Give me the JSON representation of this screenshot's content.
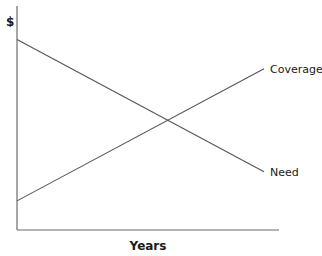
{
  "chart_data": {
    "type": "line",
    "title": "",
    "xlabel": "Years",
    "ylabel": "$",
    "x": [
      0,
      1
    ],
    "xlim": [
      0,
      1
    ],
    "ylim": [
      0,
      1
    ],
    "grid": false,
    "legend": "none (direct labels at right end of lines)",
    "series": [
      {
        "name": "Need",
        "label": "Need",
        "values": [
          0.85,
          0.26
        ]
      },
      {
        "name": "Coverage",
        "label": "Coverage",
        "values": [
          0.13,
          0.72
        ]
      }
    ],
    "annotations": [
      "Lines cross near the middle of the time axis"
    ]
  }
}
